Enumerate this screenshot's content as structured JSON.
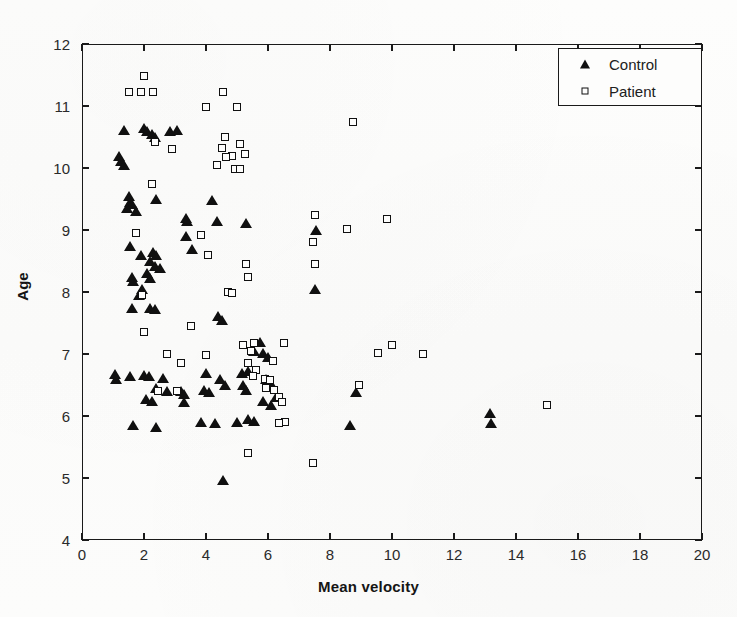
{
  "chart_data": {
    "type": "scatter",
    "title": "",
    "xlabel": "Mean velocity",
    "ylabel": "Age",
    "xlim": [
      0,
      20
    ],
    "ylim": [
      4,
      12
    ],
    "xticks": [
      0,
      2,
      4,
      6,
      8,
      10,
      12,
      14,
      16,
      18,
      20
    ],
    "yticks": [
      4,
      5,
      6,
      7,
      8,
      9,
      10,
      11,
      12
    ],
    "grid": false,
    "legend_position": "top-right",
    "series": [
      {
        "name": "Control",
        "marker": "filled-triangle",
        "color": "#101010",
        "points": [
          [
            1.35,
            10.62
          ],
          [
            1.2,
            10.2
          ],
          [
            1.25,
            10.12
          ],
          [
            1.35,
            10.05
          ],
          [
            2.0,
            10.65
          ],
          [
            2.1,
            10.6
          ],
          [
            2.25,
            10.55
          ],
          [
            2.35,
            10.5
          ],
          [
            3.05,
            10.62
          ],
          [
            1.5,
            9.55
          ],
          [
            1.55,
            9.45
          ],
          [
            1.6,
            9.42
          ],
          [
            1.45,
            9.35
          ],
          [
            2.4,
            9.5
          ],
          [
            4.2,
            9.48
          ],
          [
            4.35,
            9.15
          ],
          [
            1.75,
            9.3
          ],
          [
            1.55,
            8.75
          ],
          [
            1.9,
            8.6
          ],
          [
            2.3,
            8.65
          ],
          [
            2.4,
            8.6
          ],
          [
            2.2,
            8.5
          ],
          [
            2.35,
            8.42
          ],
          [
            2.5,
            8.38
          ],
          [
            3.35,
            8.9
          ],
          [
            3.55,
            8.7
          ],
          [
            5.3,
            9.12
          ],
          [
            1.6,
            8.25
          ],
          [
            1.65,
            8.18
          ],
          [
            2.1,
            8.3
          ],
          [
            2.2,
            8.22
          ],
          [
            1.95,
            8.05
          ],
          [
            1.85,
            7.95
          ],
          [
            1.6,
            7.75
          ],
          [
            2.2,
            7.75
          ],
          [
            2.35,
            7.72
          ],
          [
            4.4,
            7.62
          ],
          [
            4.5,
            7.55
          ],
          [
            5.75,
            7.2
          ],
          [
            5.55,
            7.05
          ],
          [
            5.85,
            7.02
          ],
          [
            6.0,
            6.95
          ],
          [
            1.05,
            6.68
          ],
          [
            1.1,
            6.6
          ],
          [
            1.55,
            6.65
          ],
          [
            2.0,
            6.66
          ],
          [
            2.15,
            6.64
          ],
          [
            2.6,
            6.62
          ],
          [
            4.0,
            6.7
          ],
          [
            4.45,
            6.6
          ],
          [
            5.15,
            6.7
          ],
          [
            5.35,
            6.72
          ],
          [
            2.4,
            6.45
          ],
          [
            2.75,
            6.4
          ],
          [
            3.2,
            6.4
          ],
          [
            3.3,
            6.35
          ],
          [
            3.95,
            6.42
          ],
          [
            4.1,
            6.38
          ],
          [
            4.6,
            6.5
          ],
          [
            5.2,
            6.5
          ],
          [
            5.3,
            6.42
          ],
          [
            2.05,
            6.28
          ],
          [
            2.25,
            6.25
          ],
          [
            3.3,
            6.22
          ],
          [
            5.85,
            6.25
          ],
          [
            6.25,
            6.3
          ],
          [
            6.1,
            6.18
          ],
          [
            1.65,
            5.85
          ],
          [
            2.4,
            5.82
          ],
          [
            3.85,
            5.9
          ],
          [
            4.3,
            5.88
          ],
          [
            5.0,
            5.9
          ],
          [
            5.35,
            5.95
          ],
          [
            5.55,
            5.92
          ],
          [
            8.65,
            5.85
          ],
          [
            13.15,
            6.05
          ],
          [
            13.2,
            5.88
          ],
          [
            4.55,
            4.97
          ],
          [
            7.5,
            8.05
          ],
          [
            7.55,
            9.0
          ],
          [
            8.85,
            6.38
          ],
          [
            5.95,
            6.6
          ],
          [
            6.05,
            6.55
          ],
          [
            2.85,
            10.6
          ],
          [
            3.35,
            9.2
          ],
          [
            3.4,
            9.15
          ]
        ]
      },
      {
        "name": "Patient",
        "marker": "open-square",
        "color": "#101010",
        "points": [
          [
            2.0,
            11.48
          ],
          [
            1.5,
            11.22
          ],
          [
            1.9,
            11.22
          ],
          [
            2.3,
            11.22
          ],
          [
            4.55,
            11.22
          ],
          [
            4.0,
            10.98
          ],
          [
            5.0,
            10.98
          ],
          [
            2.35,
            10.42
          ],
          [
            2.9,
            10.3
          ],
          [
            4.6,
            10.5
          ],
          [
            4.5,
            10.32
          ],
          [
            5.1,
            10.38
          ],
          [
            4.85,
            10.2
          ],
          [
            4.65,
            10.18
          ],
          [
            5.25,
            10.22
          ],
          [
            4.35,
            10.05
          ],
          [
            4.95,
            9.98
          ],
          [
            5.1,
            9.98
          ],
          [
            8.75,
            10.75
          ],
          [
            2.25,
            9.75
          ],
          [
            1.75,
            8.95
          ],
          [
            3.85,
            8.92
          ],
          [
            4.05,
            8.6
          ],
          [
            5.3,
            8.45
          ],
          [
            5.35,
            8.25
          ],
          [
            4.7,
            8.0
          ],
          [
            4.85,
            7.98
          ],
          [
            1.95,
            7.95
          ],
          [
            2.0,
            7.35
          ],
          [
            3.5,
            7.45
          ],
          [
            7.5,
            9.25
          ],
          [
            7.45,
            8.8
          ],
          [
            7.5,
            8.45
          ],
          [
            8.55,
            9.02
          ],
          [
            9.85,
            9.18
          ],
          [
            2.75,
            7.0
          ],
          [
            4.0,
            6.98
          ],
          [
            5.2,
            7.15
          ],
          [
            5.55,
            7.18
          ],
          [
            5.45,
            7.05
          ],
          [
            5.35,
            6.85
          ],
          [
            5.6,
            6.75
          ],
          [
            5.5,
            6.65
          ],
          [
            5.9,
            6.6
          ],
          [
            6.05,
            6.58
          ],
          [
            5.95,
            6.45
          ],
          [
            6.2,
            6.42
          ],
          [
            6.35,
            6.3
          ],
          [
            6.45,
            6.22
          ],
          [
            6.55,
            5.9
          ],
          [
            6.35,
            5.88
          ],
          [
            10.0,
            7.15
          ],
          [
            11.0,
            7.0
          ],
          [
            9.55,
            7.02
          ],
          [
            8.95,
            6.5
          ],
          [
            15.0,
            6.18
          ],
          [
            7.45,
            5.25
          ],
          [
            5.35,
            5.4
          ],
          [
            6.5,
            7.18
          ],
          [
            3.2,
            6.85
          ],
          [
            6.15,
            6.88
          ],
          [
            3.05,
            6.4
          ],
          [
            2.45,
            6.4
          ]
        ]
      }
    ]
  },
  "axes": {
    "x_label": "Mean velocity",
    "y_label": "Age",
    "x_tick_labels": [
      "0",
      "2",
      "4",
      "6",
      "8",
      "10",
      "12",
      "14",
      "16",
      "18",
      "20"
    ],
    "y_tick_labels": [
      "4",
      "5",
      "6",
      "7",
      "8",
      "9",
      "10",
      "11",
      "12"
    ]
  },
  "legend": {
    "entries": [
      {
        "label": "Control",
        "marker": "filled-triangle-icon"
      },
      {
        "label": "Patient",
        "marker": "open-square-icon"
      }
    ]
  },
  "colors": {
    "marker": "#101010",
    "axis": "#1a1a1a",
    "background": "#fcfcfb",
    "text": "#202020"
  }
}
